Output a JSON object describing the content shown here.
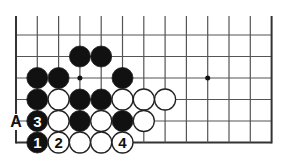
{
  "diagram": {
    "type": "go-board-fragment",
    "grid": {
      "columns": 13,
      "rows": 6,
      "origin_x": 16,
      "origin_y": 35,
      "spacing_x": 21.3,
      "spacing_y": 21.5,
      "top_extension": 19,
      "left_edge": true,
      "right_edge": true,
      "bottom_edge": true,
      "line_color": "#555555",
      "edge_color": "#333333"
    },
    "star_points": [
      {
        "col": 3,
        "row": 2
      },
      {
        "col": 9,
        "row": 2
      }
    ],
    "stones": [
      {
        "col": 3,
        "row": 1,
        "color": "black",
        "label": ""
      },
      {
        "col": 4,
        "row": 1,
        "color": "black",
        "label": ""
      },
      {
        "col": 1,
        "row": 2,
        "color": "black",
        "label": ""
      },
      {
        "col": 2,
        "row": 2,
        "color": "black",
        "label": ""
      },
      {
        "col": 5,
        "row": 2,
        "color": "black",
        "label": ""
      },
      {
        "col": 1,
        "row": 3,
        "color": "black",
        "label": ""
      },
      {
        "col": 2,
        "row": 3,
        "color": "white",
        "label": ""
      },
      {
        "col": 3,
        "row": 3,
        "color": "black",
        "label": ""
      },
      {
        "col": 4,
        "row": 3,
        "color": "black",
        "label": ""
      },
      {
        "col": 5,
        "row": 3,
        "color": "white",
        "label": ""
      },
      {
        "col": 6,
        "row": 3,
        "color": "white",
        "label": ""
      },
      {
        "col": 7,
        "row": 3,
        "color": "white",
        "label": ""
      },
      {
        "col": 1,
        "row": 4,
        "color": "black",
        "label": "3"
      },
      {
        "col": 2,
        "row": 4,
        "color": "white",
        "label": ""
      },
      {
        "col": 3,
        "row": 4,
        "color": "black",
        "label": ""
      },
      {
        "col": 4,
        "row": 4,
        "color": "white",
        "label": ""
      },
      {
        "col": 5,
        "row": 4,
        "color": "black",
        "label": ""
      },
      {
        "col": 6,
        "row": 4,
        "color": "white",
        "label": ""
      },
      {
        "col": 1,
        "row": 5,
        "color": "black",
        "label": "1"
      },
      {
        "col": 2,
        "row": 5,
        "color": "white",
        "label": "2"
      },
      {
        "col": 3,
        "row": 5,
        "color": "white",
        "label": ""
      },
      {
        "col": 4,
        "row": 5,
        "color": "white",
        "label": ""
      },
      {
        "col": 5,
        "row": 5,
        "color": "white",
        "label": "4"
      }
    ],
    "point_labels": [
      {
        "col": 0,
        "row": 4,
        "text": "A"
      }
    ],
    "stone_radius": 10.5,
    "colors": {
      "black_stone": "#111111",
      "white_stone": "#ffffff",
      "stone_outline": "#222222",
      "label_on_black": "#ffffff",
      "label_on_white": "#111111",
      "background": "#ffffff"
    }
  }
}
